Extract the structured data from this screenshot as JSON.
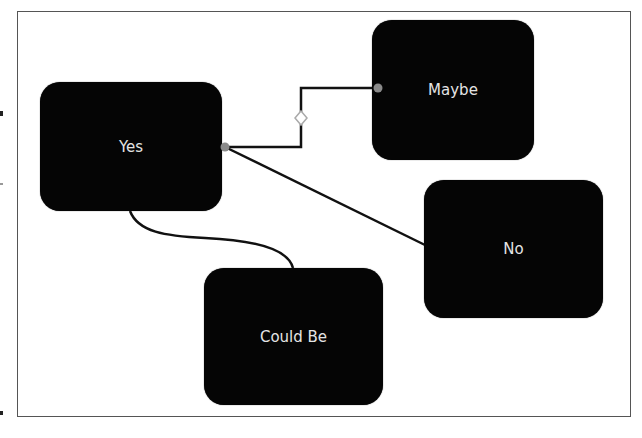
{
  "diagram": {
    "type": "flowchart",
    "frame": {
      "border_color": "#555555"
    },
    "node_color": "#050505",
    "text_color": "#e4e4e4",
    "nodes": [
      {
        "id": "yes",
        "label": "Yes",
        "x": 40,
        "y": 82,
        "w": 182,
        "h": 129
      },
      {
        "id": "maybe",
        "label": "Maybe",
        "x": 372,
        "y": 20,
        "w": 162,
        "h": 140
      },
      {
        "id": "no",
        "label": "No",
        "x": 424,
        "y": 180,
        "w": 179,
        "h": 138
      },
      {
        "id": "could_be",
        "label": "Could Be",
        "x": 204,
        "y": 268,
        "w": 179,
        "h": 137
      }
    ],
    "edges": [
      {
        "from": "yes",
        "to": "maybe",
        "style": "elbow"
      },
      {
        "from": "yes",
        "to": "no",
        "style": "straight"
      },
      {
        "from": "yes",
        "to": "could_be",
        "style": "curved"
      }
    ],
    "handles": {
      "connection_point_color": "#8a8a8a",
      "midpoint_handle": "diamond"
    }
  }
}
